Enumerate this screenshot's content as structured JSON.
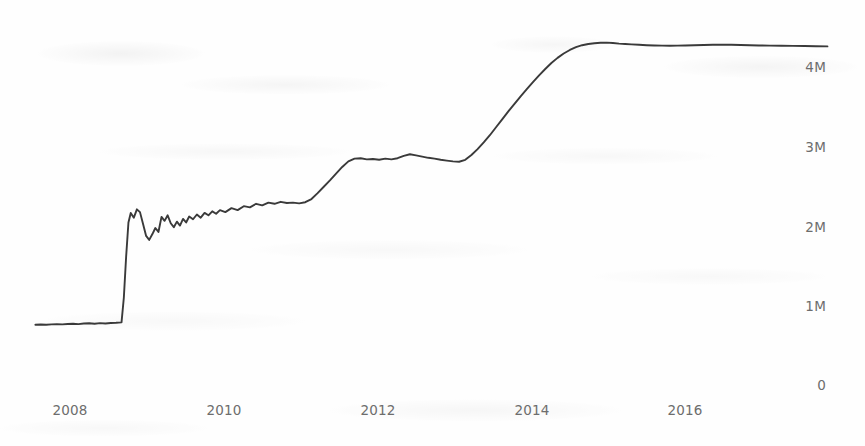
{
  "chart_data": {
    "type": "line",
    "title": "",
    "subtitle": "",
    "xlabel": "",
    "ylabel": "",
    "grid": false,
    "legend": null,
    "legend_position": "none",
    "line_color": "#3a3a3a",
    "background_color": "#fefefe",
    "tick_label_color": "#6d6d6d",
    "xlim": [
      2007.3,
      2017.9
    ],
    "ylim": [
      0,
      4600000
    ],
    "x_tick_labels": [
      "2008",
      "2010",
      "2012",
      "2014",
      "2016"
    ],
    "x_tick_values": [
      2008,
      2010,
      2012,
      2014,
      2016
    ],
    "y_tick_labels": [
      "0",
      "1M",
      "2M",
      "3M",
      "4M"
    ],
    "y_tick_values": [
      0,
      1000000,
      2000000,
      3000000,
      4000000
    ],
    "series_name": "value",
    "x": [
      2007.55,
      2007.62,
      2007.69,
      2007.76,
      2007.83,
      2007.9,
      2007.97,
      2008.04,
      2008.11,
      2008.18,
      2008.25,
      2008.32,
      2008.39,
      2008.46,
      2008.53,
      2008.6,
      2008.67,
      2008.7,
      2008.73,
      2008.76,
      2008.79,
      2008.83,
      2008.87,
      2008.91,
      2008.95,
      2008.99,
      2009.03,
      2009.07,
      2009.11,
      2009.15,
      2009.19,
      2009.23,
      2009.27,
      2009.31,
      2009.35,
      2009.39,
      2009.43,
      2009.47,
      2009.51,
      2009.55,
      2009.6,
      2009.65,
      2009.7,
      2009.75,
      2009.8,
      2009.85,
      2009.9,
      2009.95,
      2010.02,
      2010.1,
      2010.18,
      2010.26,
      2010.34,
      2010.42,
      2010.5,
      2010.58,
      2010.66,
      2010.74,
      2010.82,
      2010.9,
      2010.98,
      2011.06,
      2011.14,
      2011.22,
      2011.3,
      2011.38,
      2011.46,
      2011.54,
      2011.62,
      2011.7,
      2011.78,
      2011.86,
      2011.94,
      2012.02,
      2012.1,
      2012.18,
      2012.26,
      2012.34,
      2012.42,
      2012.5,
      2012.58,
      2012.66,
      2012.74,
      2012.82,
      2012.9,
      2012.98,
      2013.06,
      2013.14,
      2013.22,
      2013.3,
      2013.38,
      2013.46,
      2013.54,
      2013.62,
      2013.7,
      2013.78,
      2013.86,
      2013.94,
      2014.02,
      2014.1,
      2014.18,
      2014.26,
      2014.34,
      2014.42,
      2014.5,
      2014.58,
      2014.66,
      2014.74,
      2014.82,
      2014.9,
      2014.98,
      2015.06,
      2015.14,
      2015.22,
      2015.3,
      2015.4,
      2015.5,
      2015.6,
      2015.7,
      2015.8,
      2015.9,
      2016.0,
      2016.12,
      2016.24,
      2016.36,
      2016.48,
      2016.6,
      2016.72,
      2016.84,
      2016.96,
      2017.1,
      2017.25,
      2017.4,
      2017.55,
      2017.7,
      2017.85
    ],
    "y": [
      760000,
      762000,
      759000,
      765000,
      768000,
      764000,
      770000,
      772000,
      768000,
      775000,
      778000,
      772000,
      780000,
      776000,
      782000,
      785000,
      790000,
      1100000,
      1620000,
      2050000,
      2170000,
      2110000,
      2215000,
      2180000,
      2030000,
      1880000,
      1830000,
      1900000,
      1980000,
      1930000,
      2120000,
      2070000,
      2140000,
      2040000,
      1990000,
      2060000,
      2010000,
      2095000,
      2050000,
      2125000,
      2090000,
      2150000,
      2110000,
      2170000,
      2140000,
      2190000,
      2160000,
      2205000,
      2180000,
      2230000,
      2205000,
      2255000,
      2240000,
      2285000,
      2265000,
      2300000,
      2285000,
      2310000,
      2295000,
      2300000,
      2290000,
      2305000,
      2345000,
      2420000,
      2500000,
      2580000,
      2665000,
      2750000,
      2820000,
      2855000,
      2860000,
      2845000,
      2850000,
      2840000,
      2855000,
      2845000,
      2860000,
      2890000,
      2910000,
      2895000,
      2880000,
      2865000,
      2855000,
      2840000,
      2830000,
      2820000,
      2815000,
      2840000,
      2900000,
      2975000,
      3060000,
      3150000,
      3250000,
      3350000,
      3450000,
      3545000,
      3640000,
      3730000,
      3820000,
      3905000,
      3985000,
      4060000,
      4125000,
      4180000,
      4225000,
      4260000,
      4285000,
      4300000,
      4310000,
      4315000,
      4318000,
      4312000,
      4305000,
      4300000,
      4295000,
      4290000,
      4285000,
      4282000,
      4280000,
      4278000,
      4280000,
      4282000,
      4285000,
      4288000,
      4290000,
      4292000,
      4290000,
      4288000,
      4285000,
      4282000,
      4280000,
      4278000,
      4276000,
      4274000,
      4272000,
      4270000
    ]
  }
}
